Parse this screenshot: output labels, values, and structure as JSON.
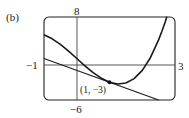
{
  "panel_label": "(b)",
  "chart_data": {
    "type": "line",
    "title": "",
    "xlabel": "",
    "ylabel": "",
    "xlim": [
      -1,
      3
    ],
    "ylim": [
      -6,
      8
    ],
    "tick_labels": {
      "xmin": "−1",
      "xmax": "3",
      "ymax": "8",
      "ymin": "−6"
    },
    "grid": false,
    "series": [
      {
        "name": "curve f(x) = x^3 - 5x + 1",
        "x": [
          -1,
          -0.75,
          -0.5,
          -0.25,
          0,
          0.25,
          0.5,
          0.75,
          1,
          1.25,
          1.5,
          1.75,
          2,
          2.25,
          2.5,
          2.6,
          2.7,
          2.75
        ],
        "y": [
          5,
          4.33,
          3.38,
          2.23,
          1,
          -0.23,
          -1.38,
          -2.33,
          -3,
          -3.3,
          -3.13,
          -2.39,
          -1,
          1.14,
          4.13,
          5.58,
          7.18,
          8.05
        ]
      },
      {
        "name": "tangent line y = -2x - 1",
        "x": [
          -1,
          2.5
        ],
        "y": [
          1,
          -6
        ]
      }
    ],
    "annotations": [
      {
        "label": "(1, −3)",
        "x": 1,
        "y": -3,
        "marker": "dot"
      }
    ]
  }
}
